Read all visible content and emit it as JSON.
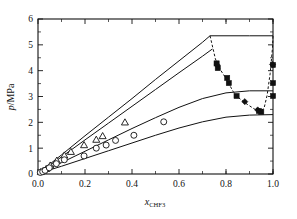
{
  "chart_data": {
    "type": "scatter",
    "title": "",
    "xlabel": "x_CHF3",
    "xlabel_base": "x",
    "xlabel_sub": "CHF",
    "xlabel_sub_num": "3",
    "ylabel": "p/MPa",
    "ylabel_symbol": "p",
    "ylabel_unit": "/MPa",
    "xlim": [
      0.0,
      1.0
    ],
    "ylim": [
      0,
      6
    ],
    "xticks": [
      0.0,
      0.2,
      0.4,
      0.6,
      0.8,
      1.0
    ],
    "xtick_labels": [
      "0.0",
      "0.2",
      "0.4",
      "0.6",
      "0.8",
      "1.0"
    ],
    "xminor_step": 0.1,
    "yticks": [
      0,
      1,
      2,
      3,
      4,
      5,
      6
    ],
    "ytick_labels": [
      "0",
      "1",
      "2",
      "3",
      "4",
      "5",
      "6"
    ],
    "yminor_step": 0.5,
    "grid": false,
    "legend": "none",
    "marker_color": "#111111",
    "series": [
      {
        "name": "open-triangles",
        "marker": "triangle-open",
        "points": [
          [
            0.012,
            0.08
          ],
          [
            0.022,
            0.12
          ],
          [
            0.035,
            0.2
          ],
          [
            0.052,
            0.33
          ],
          [
            0.08,
            0.52
          ],
          [
            0.112,
            0.72
          ],
          [
            0.14,
            0.86
          ],
          [
            0.196,
            1.12
          ],
          [
            0.248,
            1.33
          ],
          [
            0.275,
            1.47
          ],
          [
            0.37,
            2.0
          ]
        ]
      },
      {
        "name": "open-circles",
        "marker": "circle-open",
        "points": [
          [
            0.01,
            0.06
          ],
          [
            0.02,
            0.09
          ],
          [
            0.03,
            0.14
          ],
          [
            0.048,
            0.24
          ],
          [
            0.078,
            0.4
          ],
          [
            0.112,
            0.55
          ],
          [
            0.196,
            0.7
          ],
          [
            0.248,
            1.0
          ],
          [
            0.29,
            1.12
          ],
          [
            0.33,
            1.3
          ],
          [
            0.408,
            1.5
          ],
          [
            0.535,
            2.02
          ]
        ]
      },
      {
        "name": "filled-squares",
        "marker": "square-filled",
        "points": [
          [
            0.76,
            4.28
          ],
          [
            0.765,
            4.1
          ],
          [
            0.805,
            3.72
          ],
          [
            0.812,
            3.52
          ],
          [
            0.845,
            3.02
          ],
          [
            0.94,
            2.44
          ],
          [
            0.95,
            2.4
          ],
          [
            1.0,
            4.22
          ],
          [
            1.0,
            3.52
          ],
          [
            1.0,
            3.02
          ]
        ]
      },
      {
        "name": "filled-diamonds",
        "marker": "diamond-filled",
        "points": [
          [
            0.762,
            4.22
          ],
          [
            0.88,
            2.8
          ],
          [
            0.935,
            2.48
          ],
          [
            0.998,
            4.24
          ]
        ]
      }
    ],
    "curves": [
      {
        "name": "model-curve-top",
        "style": "solid",
        "points": [
          [
            0.0,
            0.02
          ],
          [
            0.1,
            0.74
          ],
          [
            0.2,
            1.48
          ],
          [
            0.3,
            2.2
          ],
          [
            0.4,
            2.92
          ],
          [
            0.5,
            3.66
          ],
          [
            0.6,
            4.38
          ],
          [
            0.7,
            5.1
          ],
          [
            0.732,
            5.35
          ],
          [
            0.8,
            5.35
          ],
          [
            0.9,
            5.35
          ],
          [
            1.0,
            5.35
          ]
        ]
      },
      {
        "name": "model-curve-second",
        "style": "solid",
        "points": [
          [
            0.0,
            0.02
          ],
          [
            0.1,
            0.66
          ],
          [
            0.2,
            1.32
          ],
          [
            0.3,
            1.97
          ],
          [
            0.4,
            2.62
          ],
          [
            0.5,
            3.27
          ],
          [
            0.6,
            3.92
          ],
          [
            0.7,
            4.56
          ],
          [
            0.742,
            4.84
          ]
        ]
      },
      {
        "name": "model-curve-third",
        "style": "solid",
        "points": [
          [
            0.0,
            0.02
          ],
          [
            0.1,
            0.44
          ],
          [
            0.2,
            0.88
          ],
          [
            0.3,
            1.32
          ],
          [
            0.4,
            1.76
          ],
          [
            0.5,
            2.18
          ],
          [
            0.6,
            2.58
          ],
          [
            0.7,
            2.92
          ],
          [
            0.8,
            3.14
          ],
          [
            0.9,
            3.22
          ],
          [
            1.0,
            3.22
          ]
        ]
      },
      {
        "name": "model-curve-bottom",
        "style": "solid",
        "points": [
          [
            0.0,
            0.02
          ],
          [
            0.1,
            0.3
          ],
          [
            0.2,
            0.6
          ],
          [
            0.3,
            0.9
          ],
          [
            0.4,
            1.2
          ],
          [
            0.5,
            1.5
          ],
          [
            0.6,
            1.78
          ],
          [
            0.7,
            2.02
          ],
          [
            0.8,
            2.2
          ],
          [
            0.9,
            2.28
          ],
          [
            1.0,
            2.3
          ]
        ]
      },
      {
        "name": "vle-dashed-curve",
        "style": "dashed",
        "points": [
          [
            0.732,
            5.35
          ],
          [
            0.755,
            4.45
          ],
          [
            0.775,
            4.05
          ],
          [
            0.8,
            3.7
          ],
          [
            0.83,
            3.2
          ],
          [
            0.86,
            2.9
          ],
          [
            0.89,
            2.7
          ],
          [
            0.92,
            2.52
          ],
          [
            0.945,
            2.42
          ],
          [
            0.962,
            2.55
          ],
          [
            0.975,
            3.05
          ],
          [
            0.988,
            3.9
          ],
          [
            0.998,
            4.9
          ],
          [
            1.0,
            5.35
          ]
        ]
      }
    ]
  },
  "axes_geometry": {
    "left_px": 38,
    "right_px": 273,
    "top_px": 19,
    "bottom_px": 174
  }
}
